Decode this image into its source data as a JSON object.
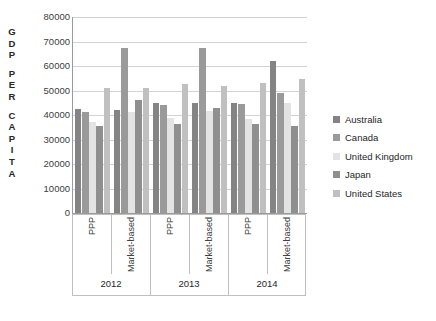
{
  "chart_data": {
    "type": "bar",
    "title": "",
    "xlabel": "",
    "ylabel": "G D P   P E R   C A P I T A",
    "ylabel_letters": [
      "G",
      "D",
      "P",
      "",
      "P",
      "E",
      "R",
      "",
      "C",
      "A",
      "P",
      "I",
      "T",
      "A"
    ],
    "ylim": [
      0,
      80000
    ],
    "yticks": [
      80000,
      70000,
      60000,
      50000,
      40000,
      30000,
      20000,
      10000,
      0
    ],
    "ytick_labels": [
      "80000",
      "70000",
      "60000",
      "50000",
      "40000",
      "30000",
      "20000",
      "10000",
      "0"
    ],
    "grid": true,
    "legend_position": "right",
    "categories": [
      "PPP",
      "Market-based",
      "PPP",
      "Market-based",
      "PPP",
      "Market-based"
    ],
    "group_labels": [
      "2012",
      "2013",
      "2014"
    ],
    "series": [
      {
        "name": "Australia",
        "color": "#848484",
        "values": [
          42300,
          42000,
          44800,
          45000,
          45100,
          62000
        ]
      },
      {
        "name": "Canada",
        "color": "#9a9a9a",
        "values": [
          41300,
          67500,
          44000,
          67300,
          44300,
          49000
        ]
      },
      {
        "name": "United Kingdom",
        "color": "#e3e3e3",
        "values": [
          37200,
          41200,
          38700,
          41600,
          38500,
          44800
        ]
      },
      {
        "name": "Japan",
        "color": "#8f8f8f",
        "values": [
          35400,
          46200,
          36300,
          43000,
          36200,
          35700
        ]
      },
      {
        "name": "United States",
        "color": "#c0c0c0",
        "values": [
          51200,
          51200,
          52700,
          51700,
          53000,
          54500
        ]
      }
    ]
  },
  "legend": {
    "items": [
      {
        "label": "Australia",
        "color": "#848484"
      },
      {
        "label": "Canada",
        "color": "#9a9a9a"
      },
      {
        "label": "United Kingdom",
        "color": "#e3e3e3"
      },
      {
        "label": "Japan",
        "color": "#8f8f8f"
      },
      {
        "label": "United States",
        "color": "#c0c0c0"
      }
    ]
  }
}
